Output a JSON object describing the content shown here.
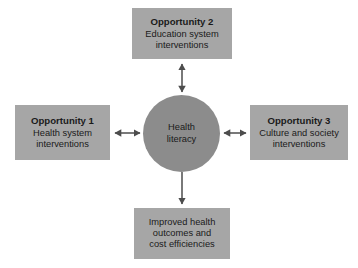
{
  "diagram": {
    "type": "hub-and-spoke concept diagram",
    "background_color": "#ffffff",
    "box_color": "#a6a6a6",
    "circle_color": "#8c8c8c",
    "text_color": "#1a1a1a",
    "arrow_color": "#4d4d4d",
    "center": {
      "line1": "Health",
      "line2": "literacy"
    },
    "nodes": {
      "left": {
        "title": "Opportunity 1",
        "line1": "Health system",
        "line2": "interventions"
      },
      "top": {
        "title": "Opportunity 2",
        "line1": "Education system",
        "line2": "interventions"
      },
      "right": {
        "title": "Opportunity 3",
        "line1": "Culture and society",
        "line2": "interventions"
      },
      "bottom": {
        "line1": "Improved health",
        "line2": "outcomes and",
        "line3": "cost efficiencies"
      }
    },
    "arrows": {
      "left": "double-headed",
      "top": "double-headed",
      "right": "double-headed",
      "bottom": "single-headed-down"
    }
  }
}
